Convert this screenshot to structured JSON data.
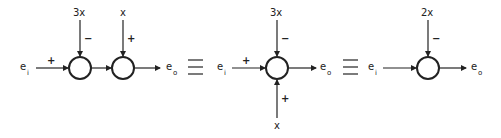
{
  "diagrams": [
    {
      "input": {
        "name": "e",
        "sub": "i"
      },
      "output": {
        "name": "e",
        "sub": "o"
      },
      "in_sign": "+",
      "junctions": [
        {
          "top_label": "3x",
          "top_sign": "−"
        },
        {
          "top_label": "x",
          "top_sign": "+"
        }
      ]
    },
    {
      "input": {
        "name": "e",
        "sub": "i"
      },
      "output": {
        "name": "e",
        "sub": "o"
      },
      "in_sign": "+",
      "junction": {
        "top_label": "3x",
        "top_sign": "−",
        "bottom_label": "x",
        "bottom_sign": "+"
      }
    },
    {
      "input": {
        "name": "e",
        "sub": "i"
      },
      "output": {
        "name": "e",
        "sub": "o"
      },
      "junction": {
        "top_label": "2x",
        "top_sign": "−"
      }
    }
  ],
  "equivalence_symbol": "≡"
}
